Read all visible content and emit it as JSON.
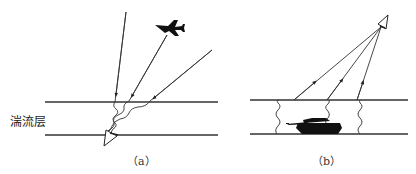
{
  "figure": {
    "panels": [
      {
        "id": "a",
        "caption": "（a）",
        "layer_label": "湍流层",
        "description": "Light rays from above (including from an aircraft) pass through the turbulent layer and are distorted before reaching a ground-level receiver"
      },
      {
        "id": "b",
        "caption": "（b）",
        "description": "Light from a tank on the ground passes through the turbulent layer upward to an airborne receiver"
      }
    ],
    "colors": {
      "line": "#333333",
      "fill": "#111111",
      "background": "#ffffff"
    }
  }
}
